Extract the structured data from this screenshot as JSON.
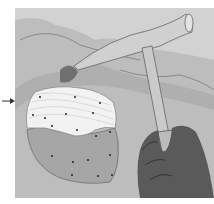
{
  "illustration": {
    "subject": "rock hammer chipping a fossil shell from rock",
    "colors": {
      "background": "#ffffff",
      "rock": "#b9b9b9",
      "rock_dark": "#7a7a7a",
      "shell_exposed": "#f2f2f2",
      "shell_buried": "#a8a8a8",
      "hammer": "#c8c8c8",
      "hand": "#5a5a5a",
      "arrow": "#333333"
    },
    "arrow": {
      "direction": "right",
      "points_to": "exposed-shell"
    }
  }
}
